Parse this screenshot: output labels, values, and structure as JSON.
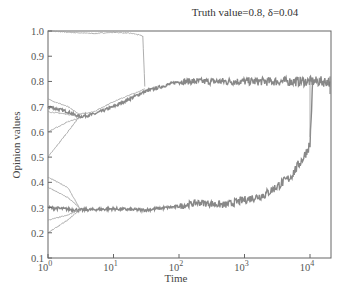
{
  "chart_data": {
    "type": "line",
    "title": "Truth value=0.8, δ=0.04",
    "xlabel": "Time",
    "ylabel": "Opinion values",
    "xscale": "log",
    "xlim": [
      1,
      20000
    ],
    "ylim": [
      0.1,
      1.0
    ],
    "grid": false,
    "legend": null,
    "x_tick_labels": [
      "10^0",
      "10^1",
      "10^2",
      "10^3",
      "10^4"
    ],
    "y_tick_labels": [
      "0.1",
      "0.2",
      "0.3",
      "0.4",
      "0.5",
      "0.6",
      "0.7",
      "0.8",
      "0.9",
      "1.0"
    ],
    "series": [
      {
        "name": "upper-start-1.0",
        "x": [
          1,
          2,
          5,
          10,
          20,
          28,
          30
        ],
        "values": [
          1.0,
          0.995,
          0.99,
          0.995,
          0.99,
          0.98,
          0.78
        ]
      },
      {
        "name": "upper-cluster",
        "x": [
          1,
          2,
          3,
          5,
          10,
          30,
          100,
          1000,
          10000,
          20000
        ],
        "values": [
          0.7,
          0.68,
          0.66,
          0.67,
          0.7,
          0.76,
          0.8,
          0.8,
          0.8,
          0.8
        ]
      },
      {
        "name": "upper-start-0.73",
        "x": [
          1,
          2,
          3,
          5,
          10,
          30
        ],
        "values": [
          0.73,
          0.7,
          0.67,
          0.68,
          0.72,
          0.77
        ]
      },
      {
        "name": "upper-start-0.68",
        "x": [
          1,
          2,
          3
        ],
        "values": [
          0.68,
          0.67,
          0.66
        ]
      },
      {
        "name": "upper-start-0.6",
        "x": [
          1,
          2,
          3
        ],
        "values": [
          0.6,
          0.64,
          0.655
        ]
      },
      {
        "name": "upper-start-0.5",
        "x": [
          1,
          2,
          3
        ],
        "values": [
          0.5,
          0.6,
          0.66
        ]
      },
      {
        "name": "lower-cluster",
        "x": [
          1,
          3,
          10,
          30,
          100,
          200,
          500,
          1000,
          2000,
          3000,
          5000,
          8000,
          10000,
          11000
        ],
        "values": [
          0.3,
          0.29,
          0.295,
          0.29,
          0.305,
          0.32,
          0.31,
          0.33,
          0.35,
          0.38,
          0.42,
          0.5,
          0.55,
          0.8
        ]
      },
      {
        "name": "lower-start-0.42",
        "x": [
          1,
          2,
          3
        ],
        "values": [
          0.42,
          0.38,
          0.3
        ]
      },
      {
        "name": "lower-start-0.38",
        "x": [
          1,
          2,
          3
        ],
        "values": [
          0.38,
          0.34,
          0.3
        ]
      },
      {
        "name": "lower-start-0.25",
        "x": [
          1,
          2,
          3
        ],
        "values": [
          0.25,
          0.27,
          0.29
        ]
      },
      {
        "name": "lower-start-0.2",
        "x": [
          1,
          2,
          3
        ],
        "values": [
          0.2,
          0.25,
          0.29
        ]
      }
    ]
  }
}
